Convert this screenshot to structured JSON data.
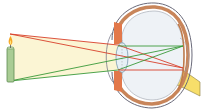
{
  "diagram": {
    "title": "Image formation in the eye",
    "elements": {
      "object": "candle",
      "optics": "eye lens",
      "screen": "retina",
      "nerve": "optic nerve"
    },
    "rays": [
      {
        "name": "ray-top-to-bottom-straight",
        "color": "#d8402a"
      },
      {
        "name": "ray-top-through-center",
        "color": "#d8402a"
      },
      {
        "name": "ray-bottom-to-top-straight",
        "color": "#3a9a3a"
      },
      {
        "name": "ray-bottom-through-center",
        "color": "#3a9a3a"
      }
    ],
    "colors": {
      "ray_red": "#d8402a",
      "ray_green": "#3a9a3a",
      "light_cone": "#faf3cc",
      "candle_body": "#a9cc94",
      "candle_outline": "#5e8a52",
      "flame": "#f6a623",
      "sclera": "#e2784a",
      "choroid": "#c8855a",
      "vitreous": "#eef2f6",
      "outline": "#6a6a7a",
      "optic_nerve": "#f7de6a"
    }
  }
}
